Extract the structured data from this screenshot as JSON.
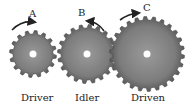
{
  "gears": [
    {
      "name": "Driver",
      "arrow_label": "A",
      "cx": 33,
      "cy": 54,
      "r": 20,
      "teeth": 16,
      "direction": "clockwise"
    },
    {
      "name": "Idler",
      "arrow_label": "B",
      "cx": 87,
      "cy": 54,
      "r": 26,
      "teeth": 20,
      "direction": "counterclockwise"
    },
    {
      "name": "Driven",
      "arrow_label": "C",
      "cx": 147,
      "cy": 54,
      "r": 34,
      "teeth": 26,
      "direction": "clockwise"
    }
  ],
  "colors": {
    "gear_fill": "#7f7f7f",
    "gear_dark": "#555555",
    "hub": "#ffffff",
    "arrow": "#222222"
  },
  "labels": {
    "driver": "Driver",
    "idler": "Idler",
    "driven": "Driven",
    "a": "A",
    "b": "B",
    "c": "C"
  }
}
